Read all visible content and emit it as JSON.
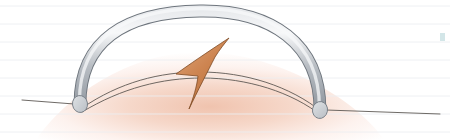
{
  "figure": {
    "title": "Surgical illustration: arched tube over raised tissue with directional arrow",
    "domain_kind": "scanned-medical-illustration",
    "width": 450,
    "height": 140,
    "background_color": "#ffffff"
  },
  "scan_lines": {
    "name": "scanner-ruling-lines",
    "color": "#eceef1",
    "opacity": 0.85,
    "thickness": 1,
    "y_positions": [
      6,
      24,
      42,
      60,
      78,
      96,
      114,
      132
    ]
  },
  "tissue": {
    "name": "tissue-mound",
    "label": "raised soft-tissue mound",
    "fill_center_color": "#f0c3ae",
    "fill_mid_color": "#f6d8ca",
    "fill_edge_color": "#fdf2ee",
    "fill_outer_color": "#ffffff",
    "gradient_center_x": 200,
    "gradient_center_y": 92,
    "gradient_radius": 165,
    "apex_x": 200,
    "apex_y": 52,
    "baseline_y": 140,
    "left_x": 36,
    "right_x": 384
  },
  "tube": {
    "name": "arched-tube",
    "label": "arched cylindrical tube / wire loop",
    "body_color": "#b9bec4",
    "body_light_color": "#e8eaed",
    "body_dark_color": "#8e959d",
    "outline_color": "#6e757d",
    "highlight_color": "#f7f8f9",
    "thickness": 11,
    "outline_width": 0.9,
    "path": "M 80 104 C 80 40, 126 12, 200 11 C 272 10, 320 44, 320 110",
    "left_cap": {
      "name": "tube-left-end-cap",
      "cx": 80,
      "cy": 104,
      "rx": 7.5,
      "ry": 8.5,
      "rotation": -8,
      "fill_color": "#dfe2e5",
      "edge_color": "#767d85"
    },
    "right_cap": {
      "name": "tube-right-end-cap",
      "cx": 320,
      "cy": 110,
      "rx": 7.5,
      "ry": 8.5,
      "rotation": 10,
      "fill_color": "#dfe2e5",
      "edge_color": "#767d85"
    }
  },
  "membrane": {
    "name": "membrane-curve",
    "label": "thin double-line tissue plane under the arch",
    "line_color": "#55504c",
    "line_width": 0.85,
    "upper_path": "M 82 108 C 120 82, 160 72, 200 72 C 245 72, 290 86, 322 112",
    "lower_path": "M 82 112 C 122 88, 162 78, 202 78 C 247 78, 292 92, 322 116"
  },
  "baseline_left": {
    "name": "baseline-left-line",
    "label": "left horizontal reference line",
    "color": "#5d5955",
    "width": 0.9,
    "path": "M 22 100 L 74 104"
  },
  "baseline_right": {
    "name": "baseline-right-line",
    "label": "right horizontal reference line",
    "color": "#5d5955",
    "width": 0.9,
    "path": "M 326 110 L 440 114"
  },
  "arrow": {
    "name": "direction-arrow",
    "label": "tan curved directional arrow",
    "fill_color": "#cd8450",
    "fill_light_color": "#dda276",
    "fill_dark_color": "#b26a38",
    "outline_color": "#7d4a23",
    "outline_width": 0.8,
    "tip_x": 229,
    "tip_y": 38,
    "tail_x": 189,
    "tail_y": 109,
    "left_x": 174,
    "left_y": 75,
    "path": "M 229 38 C 206 53, 190 64, 176 74 C 183 75, 191 75, 198 76 C 197 86, 193 99, 189 109 C 197 92, 208 71, 215 57 C 220 49, 225 43, 229 38 Z"
  },
  "teal_mark": {
    "name": "scan-artifact-mark",
    "label": "faint teal scanner artifact at right edge",
    "color": "#9ec8cb",
    "opacity": 0.45,
    "x": 440,
    "y": 33,
    "width": 5,
    "height": 8
  }
}
